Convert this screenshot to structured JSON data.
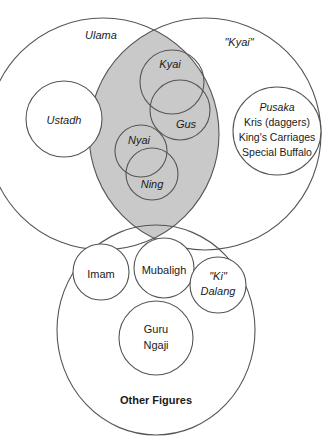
{
  "diagram": {
    "type": "venn-diagram",
    "colors": {
      "shade": "#c9c9c9",
      "stroke": "#555555",
      "background": "#ffffff",
      "text": "#1a1a1a"
    },
    "sets": {
      "ulama": {
        "label": "Ulama",
        "style": "italic"
      },
      "kyai_quoted": {
        "label": "\"Kyai\"",
        "style": "italic"
      },
      "other_figures": {
        "label": "Other Figures",
        "style": "bold"
      }
    },
    "members": {
      "ustadh": {
        "label": "Ustadh",
        "style": "italic"
      },
      "kyai": {
        "label": "Kyai",
        "style": "italic"
      },
      "gus": {
        "label": "Gus",
        "style": "italic"
      },
      "nyai": {
        "label": "Nyai",
        "style": "italic"
      },
      "ning": {
        "label": "Ning",
        "style": "italic"
      },
      "imam": {
        "label": "Imam",
        "style": "regular"
      },
      "mubaligh": {
        "label": "Mubaligh",
        "style": "regular"
      },
      "ki_dalang": {
        "line1": "\"Ki\"",
        "line2": "Dalang",
        "style": "italic"
      },
      "guru_ngaji": {
        "line1": "Guru",
        "line2": "Ngaji",
        "style": "regular"
      },
      "pusaka": {
        "line1": "Pusaka",
        "line2": "Kris (daggers)",
        "line3": "King's Carriages",
        "line4": "Special Buffalo",
        "style": "italic-first-line"
      }
    }
  }
}
